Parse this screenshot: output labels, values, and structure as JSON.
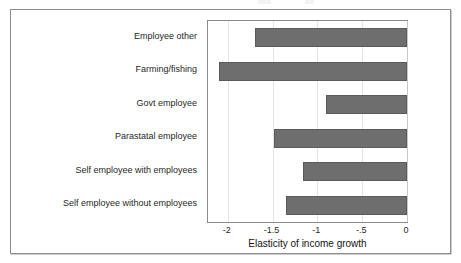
{
  "figure": {
    "has_outer_frame": true,
    "background_color": "#ffffff"
  },
  "chart_data": {
    "type": "bar",
    "orientation": "horizontal",
    "title": "",
    "xlabel": "Elasticity of income growth",
    "ylabel": "",
    "categories": [
      "Employee other",
      "Farming/fishing",
      "Govt employee",
      "Parastatal employee",
      "Self employee with employees",
      "Self employee without employees"
    ],
    "values": [
      -1.7,
      -2.1,
      -0.9,
      -1.48,
      -1.16,
      -1.35
    ],
    "xlim": [
      -2.22,
      0.0
    ],
    "xticks": [
      -2,
      -1.5,
      -1,
      -0.5,
      0
    ],
    "xticklabels": [
      "-2",
      "-1.5",
      "-1",
      "-.5",
      "0"
    ],
    "grid": true,
    "grid_axis": "x",
    "legend": false,
    "bar_color": "#6e6e6e",
    "bar_edge_color": "#5a5a5a",
    "gridline_color": "#d9d9e2",
    "axis_color": "#8a8a8a"
  }
}
